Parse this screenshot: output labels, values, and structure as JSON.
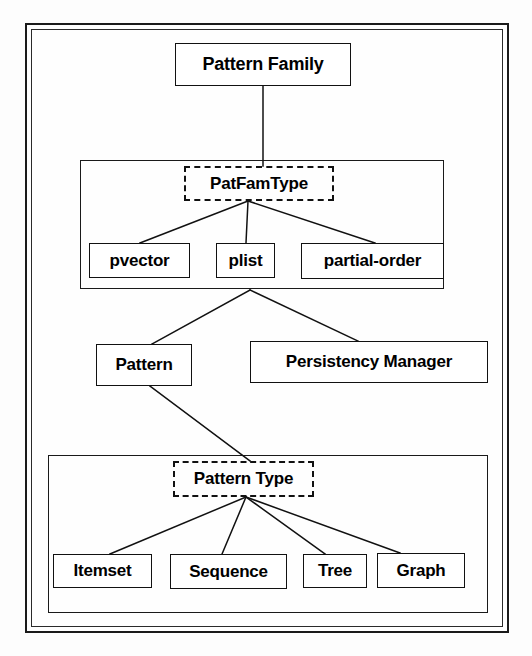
{
  "diagram": {
    "type": "class-hierarchy",
    "title_node": "Pattern Family",
    "nodes": {
      "pattern_family": {
        "label": "Pattern Family",
        "style": "solid"
      },
      "patfamtype": {
        "label": "PatFamType",
        "style": "dashed"
      },
      "pvector": {
        "label": "pvector",
        "style": "solid"
      },
      "plist": {
        "label": "plist",
        "style": "solid"
      },
      "partial_order": {
        "label": "partial-order",
        "style": "solid"
      },
      "pattern": {
        "label": "Pattern",
        "style": "solid"
      },
      "persistency_manager": {
        "label": "Persistency Manager",
        "style": "solid"
      },
      "pattern_type": {
        "label": "Pattern Type",
        "style": "dashed"
      },
      "itemset": {
        "label": "Itemset",
        "style": "solid"
      },
      "sequence": {
        "label": "Sequence",
        "style": "solid"
      },
      "tree": {
        "label": "Tree",
        "style": "solid"
      },
      "graph": {
        "label": "Graph",
        "style": "solid"
      }
    },
    "groups": [
      {
        "id": "patfamtype-group",
        "members": [
          "patfamtype",
          "pvector",
          "plist",
          "partial-order"
        ]
      },
      {
        "id": "patterntype-group",
        "members": [
          "pattern_type",
          "itemset",
          "sequence",
          "tree",
          "graph"
        ]
      }
    ],
    "edges": [
      {
        "from": "pattern_family",
        "to": "patfamtype"
      },
      {
        "from": "patfamtype",
        "to": "pvector"
      },
      {
        "from": "patfamtype",
        "to": "plist"
      },
      {
        "from": "patfamtype",
        "to": "partial_order"
      },
      {
        "from": "patfamtype_group",
        "to": "pattern"
      },
      {
        "from": "patfamtype_group",
        "to": "persistency_manager"
      },
      {
        "from": "pattern",
        "to": "pattern_type"
      },
      {
        "from": "pattern_type",
        "to": "itemset"
      },
      {
        "from": "pattern_type",
        "to": "sequence"
      },
      {
        "from": "pattern_type",
        "to": "tree"
      },
      {
        "from": "pattern_type",
        "to": "graph"
      }
    ],
    "colors": {
      "stroke": "#111111",
      "background": "#ffffff",
      "text": "#000000"
    }
  }
}
